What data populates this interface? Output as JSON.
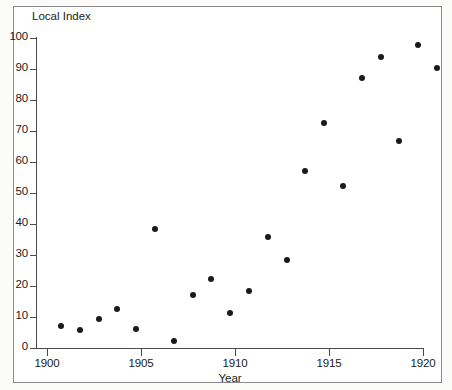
{
  "chart_data": {
    "type": "scatter",
    "title": "",
    "ylabel": "Local Index",
    "xlabel": "Year",
    "xlim": [
      1899,
      1920
    ],
    "ylim": [
      0,
      100
    ],
    "grid": false,
    "legend": null,
    "x_ticks": [
      "1900",
      "1905",
      "1910",
      "1915",
      "1920"
    ],
    "x_tick_values": [
      1900,
      1905,
      1910,
      1915,
      1920
    ],
    "y_ticks": [
      "0",
      "10",
      "20",
      "30",
      "40",
      "50",
      "60",
      "70",
      "80",
      "90",
      "100"
    ],
    "y_tick_values": [
      0,
      10,
      20,
      30,
      40,
      50,
      60,
      70,
      80,
      90,
      100
    ],
    "marker": "filled-circle",
    "marker_color": "#1a1a1a",
    "x": [
      1900,
      1901,
      1902,
      1903,
      1904,
      1905,
      1906,
      1907,
      1908,
      1909,
      1910,
      1911,
      1912,
      1913,
      1914,
      1915,
      1916,
      1917,
      1918,
      1919,
      1920
    ],
    "values": [
      9.5,
      8.0,
      11.5,
      15.0,
      8.5,
      40.5,
      4.5,
      19.5,
      24.5,
      13.5,
      20.5,
      38.0,
      30.5,
      59.5,
      75.0,
      54.5,
      89.5,
      96.0,
      69.0,
      100.0,
      92.5
    ],
    "points": [
      {
        "year": 1900,
        "value": 9.5
      },
      {
        "year": 1901,
        "value": 8.0
      },
      {
        "year": 1902,
        "value": 11.5
      },
      {
        "year": 1903,
        "value": 15.0
      },
      {
        "year": 1904,
        "value": 8.5
      },
      {
        "year": 1905,
        "value": 40.5
      },
      {
        "year": 1906,
        "value": 4.5
      },
      {
        "year": 1907,
        "value": 19.5
      },
      {
        "year": 1908,
        "value": 24.5
      },
      {
        "year": 1909,
        "value": 13.5
      },
      {
        "year": 1910,
        "value": 20.5
      },
      {
        "year": 1911,
        "value": 38.0
      },
      {
        "year": 1912,
        "value": 30.5
      },
      {
        "year": 1913,
        "value": 59.5
      },
      {
        "year": 1914,
        "value": 75.0
      },
      {
        "year": 1915,
        "value": 54.5
      },
      {
        "year": 1916,
        "value": 89.5
      },
      {
        "year": 1917,
        "value": 96.0
      },
      {
        "year": 1918,
        "value": 69.0
      },
      {
        "year": 1919,
        "value": 100.0
      },
      {
        "year": 1920,
        "value": 92.5
      }
    ]
  },
  "colors": {
    "axis": "#4a4a4a",
    "frame": "#8a8a8a",
    "marker": "#1a1a1a",
    "text": "#1b1b1b",
    "page_background": "#fbfbfa",
    "plot_background": "#ffffff"
  }
}
